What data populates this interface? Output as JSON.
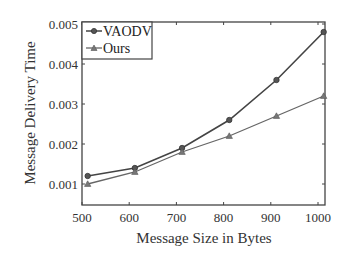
{
  "chart_data": {
    "type": "line",
    "title": "",
    "xlabel": "Message Size in Bytes",
    "ylabel": "Message Delivery Time",
    "x": [
      512,
      612,
      712,
      812,
      912,
      1012
    ],
    "series": [
      {
        "name": "VAODV",
        "marker": "circle",
        "color": "#444444",
        "values": [
          0.0012,
          0.0014,
          0.0019,
          0.0026,
          0.0036,
          0.0048
        ]
      },
      {
        "name": "Ours",
        "marker": "triangle",
        "color": "#666666",
        "values": [
          0.001,
          0.0013,
          0.0018,
          0.0022,
          0.0027,
          0.0032
        ]
      }
    ],
    "xlim": [
      500,
      1020
    ],
    "ylim": [
      0.00075,
      0.005
    ],
    "xticks": [
      500,
      600,
      700,
      800,
      900,
      1000
    ],
    "xtick_labels": [
      "500",
      "600",
      "700",
      "800",
      "900",
      "1000"
    ],
    "yticks": [
      0.001,
      0.002,
      0.003,
      0.004,
      0.005
    ],
    "ytick_labels": [
      "0.001",
      "0.002",
      "0.003",
      "0.004",
      "0.005"
    ],
    "grid": false,
    "legend_position": "upper left"
  }
}
